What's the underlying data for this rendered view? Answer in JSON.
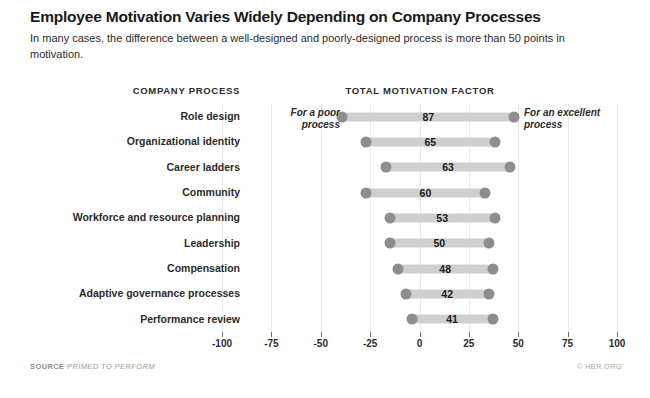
{
  "title": "Employee Motivation Varies Widely Depending on Company Processes",
  "subtitle": "In many cases, the difference between a well-designed and poorly-designed process is more than 50 points in motivation.",
  "headers": {
    "left": "COMPANY PROCESS",
    "right": "TOTAL MOTIVATION FACTOR"
  },
  "annotations": {
    "left": "For a poor process",
    "right": "For an excellent process"
  },
  "footer": {
    "source_label": "SOURCE",
    "source_value": "PRIMED TO PERFORM",
    "credit": "© HBR.ORG"
  },
  "colors": {
    "bar": "#cfcfcf",
    "cap": "#8d8d8d",
    "grid": "#e8e8e8",
    "text": "#231f20"
  },
  "chart_data": {
    "type": "bar",
    "subtype": "dumbbell-range",
    "title": "Employee Motivation Varies Widely Depending on Company Processes",
    "subtitle": "In many cases, the difference between a well-designed and poorly-designed process is more than 50 points in motivation.",
    "xlabel": "TOTAL MOTIVATION FACTOR",
    "ylabel": "COMPANY PROCESS",
    "xlim": [
      -100,
      100
    ],
    "xticks": [
      -100,
      -75,
      -50,
      -25,
      0,
      25,
      50,
      75,
      100
    ],
    "xtick_labels": [
      "-100",
      "-75",
      "-50",
      "-25",
      "0",
      "25",
      "50",
      "75",
      "100"
    ],
    "grid": true,
    "legend": false,
    "categories": [
      "Role design",
      "Organizational identity",
      "Career ladders",
      "Community",
      "Workforce and resource planning",
      "Leadership",
      "Compensation",
      "Adaptive governance processes",
      "Performance review"
    ],
    "values": [
      87,
      65,
      63,
      60,
      53,
      50,
      48,
      42,
      41
    ],
    "series": [
      {
        "name": "For a poor process",
        "values": [
          -39,
          -27,
          -17,
          -27,
          -15,
          -15,
          -11,
          -7,
          -4
        ]
      },
      {
        "name": "For an excellent process",
        "values": [
          48,
          38,
          46,
          33,
          38,
          35,
          37,
          35,
          37
        ]
      }
    ],
    "rows": [
      {
        "label": "Role design",
        "value": 87,
        "low": -39,
        "high": 48
      },
      {
        "label": "Organizational identity",
        "value": 65,
        "low": -27,
        "high": 38
      },
      {
        "label": "Career ladders",
        "value": 63,
        "low": -17,
        "high": 46
      },
      {
        "label": "Community",
        "value": 60,
        "low": -27,
        "high": 33
      },
      {
        "label": "Workforce and resource planning",
        "value": 53,
        "low": -15,
        "high": 38
      },
      {
        "label": "Leadership",
        "value": 50,
        "low": -15,
        "high": 35
      },
      {
        "label": "Compensation",
        "value": 48,
        "low": -11,
        "high": 37
      },
      {
        "label": "Adaptive governance processes",
        "value": 42,
        "low": -7,
        "high": 35
      },
      {
        "label": "Performance review",
        "value": 41,
        "low": -4,
        "high": 37
      }
    ]
  }
}
